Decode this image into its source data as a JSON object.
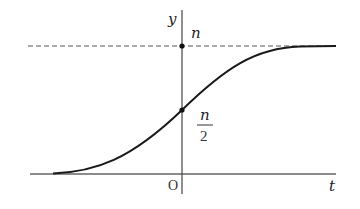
{
  "diagram": {
    "type": "logistic-curve",
    "labels": {
      "y_axis": "y",
      "x_axis": "t",
      "origin": "O",
      "asymptote": "n",
      "midpoint_numerator": "n",
      "midpoint_denominator": "2"
    },
    "colors": {
      "curve": "#1a1a1a",
      "axes": "#444444",
      "dashed": "#555555",
      "background": "#ffffff"
    },
    "points": [
      {
        "name": "asymptote-intercept",
        "label": "n"
      },
      {
        "name": "midpoint",
        "label": "n/2"
      }
    ]
  }
}
